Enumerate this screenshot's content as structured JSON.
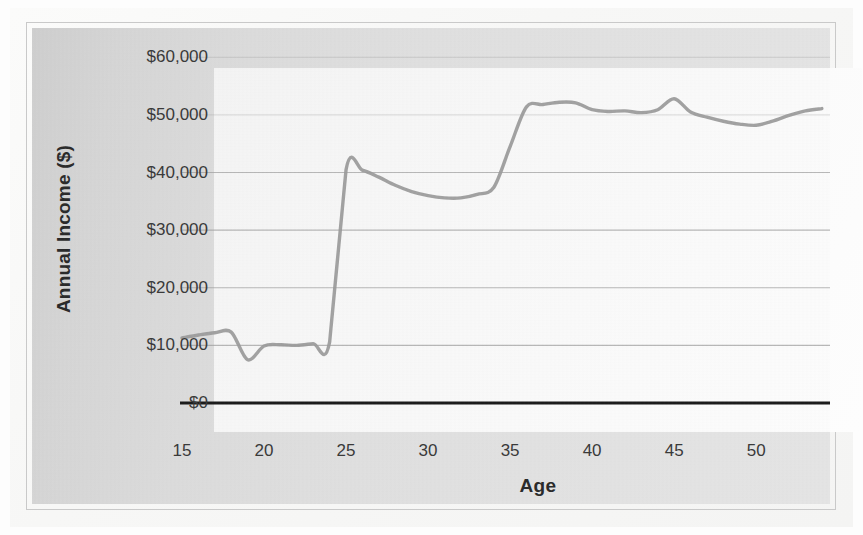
{
  "chart_data": {
    "type": "line",
    "title": "",
    "xlabel": "Age",
    "ylabel": "Annual Income ($)",
    "xlim": [
      15,
      54.5
    ],
    "ylim": [
      0,
      63000
    ],
    "grid": true,
    "legend": "none",
    "line_color": "#9a9a9a",
    "axis_color": "#1c1c1c",
    "gridline_color": "#9f9f9f",
    "background_color": "#dcdcdc",
    "plot_background_color": "#f8f8f8",
    "y_ticks": [
      {
        "value": 0,
        "label": "$0"
      },
      {
        "value": 10000,
        "label": "$10,000"
      },
      {
        "value": 20000,
        "label": "$20,000"
      },
      {
        "value": 30000,
        "label": "$30,000"
      },
      {
        "value": 40000,
        "label": "$40,000"
      },
      {
        "value": 50000,
        "label": "$50,000"
      },
      {
        "value": 60000,
        "label": "$60,000"
      }
    ],
    "x_ticks": [
      {
        "value": 15,
        "label": "15"
      },
      {
        "value": 20,
        "label": "20"
      },
      {
        "value": 25,
        "label": "25"
      },
      {
        "value": 30,
        "label": "30"
      },
      {
        "value": 35,
        "label": "35"
      },
      {
        "value": 40,
        "label": "40"
      },
      {
        "value": 45,
        "label": "45"
      },
      {
        "value": 50,
        "label": "50"
      }
    ],
    "x": [
      15,
      16,
      17,
      18,
      19,
      20,
      21,
      22,
      23,
      24,
      25,
      26,
      27,
      28,
      29,
      30,
      31,
      32,
      33,
      34,
      35,
      36,
      37,
      38,
      39,
      40,
      41,
      42,
      43,
      44,
      45,
      46,
      47,
      48,
      49,
      50,
      51,
      52,
      53,
      54
    ],
    "series": [
      {
        "name": "Annual Income",
        "values": [
          11300,
          11800,
          12200,
          12300,
          7500,
          9900,
          10100,
          10000,
          10300,
          10600,
          40500,
          40400,
          39200,
          37800,
          36700,
          36000,
          35600,
          35600,
          36200,
          37400,
          44500,
          51400,
          51800,
          52200,
          52100,
          50900,
          50600,
          50700,
          50400,
          50900,
          52800,
          50500,
          49600,
          48900,
          48400,
          48200,
          48900,
          49900,
          50700,
          51100
        ]
      }
    ],
    "annotations": []
  }
}
